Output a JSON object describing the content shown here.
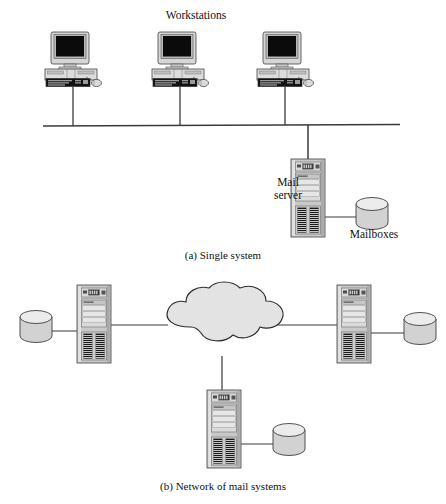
{
  "figure": {
    "width": 446,
    "height": 504,
    "background": "#ffffff"
  },
  "palette": {
    "line": "#3a3a3a",
    "case_light": "#d8d8d8",
    "case_mid": "#bdbdbd",
    "case_dark": "#8f8f8f",
    "screen": "#0b0b0b",
    "cloud_fill": "#e3e3e3",
    "cylinder_fill": "#d2d2d2",
    "cylinder_top": "#ebebeb",
    "text": "#111111"
  },
  "panel_a": {
    "caption": "(a) Single system",
    "network_label": "Workstations",
    "bus": {
      "y": 125,
      "x_start": 43,
      "x_end": 400
    },
    "workstations": [
      {
        "name": "workstation-1",
        "x": 73,
        "y": 32,
        "drop_to": 125
      },
      {
        "name": "workstation-2",
        "x": 180,
        "y": 32,
        "drop_to": 125
      },
      {
        "name": "workstation-3",
        "x": 285,
        "y": 32,
        "drop_to": 125
      }
    ],
    "server": {
      "label": "Mail\nserver",
      "x": 308,
      "y": 158,
      "stem_from": 125
    },
    "storage": {
      "label": "Mailboxes",
      "x": 372,
      "y": 212
    }
  },
  "panel_b": {
    "caption": "(b) Network of mail systems",
    "cloud": {
      "name": "internet-cloud",
      "cx": 220,
      "cy": 325
    },
    "nodes": [
      {
        "name": "mail-system-left",
        "server_x": 94,
        "server_y": 285,
        "storage_x": 36,
        "storage_y": 320,
        "link_to_cloud": true
      },
      {
        "name": "mail-system-right",
        "server_x": 354,
        "server_y": 285,
        "storage_x": 412,
        "storage_y": 320,
        "link_to_cloud": true
      },
      {
        "name": "mail-system-bottom",
        "server_x": 224,
        "server_y": 388,
        "storage_x": 282,
        "storage_y": 432,
        "link_to_cloud": true
      }
    ]
  }
}
